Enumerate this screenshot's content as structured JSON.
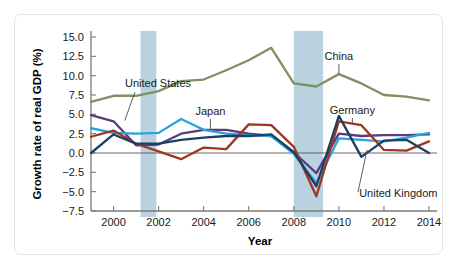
{
  "figure": {
    "y_axis_title": "Growth rate of real GDP (%)",
    "x_axis_title": "Year",
    "y_ticks": [
      "15.0",
      "12.5",
      "10.0",
      "7.5",
      "5.0",
      "2.5",
      "0.0",
      "-2.5",
      "-5.0",
      "-7.5"
    ],
    "x_ticks": [
      "2000",
      "2002",
      "2004",
      "2006",
      "2008",
      "2010",
      "2012",
      "2014"
    ],
    "annotations": {
      "united_states": "United States",
      "japan": "Japan",
      "china": "China",
      "germany": "Germany",
      "united_kingdom": "United Kingdom"
    }
  },
  "colors": {
    "united_states": "#5b3a82",
    "japan": "#29a3dd",
    "china": "#7f9163",
    "germany": "#9e3620",
    "united_kingdom": "#1d3f62",
    "recession_band": "#b9d2e0",
    "axis": "#7a7a7a",
    "card_border": "#e3e3e3"
  },
  "chart_data": {
    "type": "line",
    "title": "",
    "xlabel": "Year",
    "ylabel": "Growth rate of real GDP (%)",
    "xlim": [
      1999,
      2014
    ],
    "ylim": [
      -7.5,
      15.0
    ],
    "ytick_step": 2.5,
    "grid": false,
    "legend": "inline-annotations",
    "x": [
      1999,
      2000,
      2001,
      2002,
      2003,
      2004,
      2005,
      2006,
      2007,
      2008,
      2009,
      2010,
      2011,
      2012,
      2013,
      2014
    ],
    "series": [
      {
        "name": "China",
        "color": "#7f9163",
        "values": [
          6.6,
          7.4,
          7.4,
          8.0,
          9.3,
          9.5,
          10.7,
          12.0,
          13.6,
          9.0,
          8.6,
          10.2,
          9.0,
          7.5,
          7.3,
          6.8
        ]
      },
      {
        "name": "United States",
        "color": "#5b3a82",
        "values": [
          4.9,
          4.1,
          1.0,
          1.1,
          2.5,
          3.0,
          3.0,
          2.5,
          2.2,
          0.1,
          -2.6,
          2.5,
          2.2,
          2.3,
          2.3,
          2.4
        ]
      },
      {
        "name": "Japan",
        "color": "#29a3dd",
        "values": [
          3.2,
          2.6,
          2.5,
          2.6,
          4.4,
          3.0,
          2.5,
          2.3,
          2.2,
          -0.1,
          -3.9,
          1.9,
          1.7,
          1.5,
          2.0,
          2.6
        ]
      },
      {
        "name": "Germany",
        "color": "#9e3620",
        "values": [
          2.1,
          2.9,
          1.2,
          0.2,
          -0.8,
          0.7,
          0.5,
          3.7,
          3.6,
          0.8,
          -5.6,
          4.1,
          3.6,
          0.4,
          0.3,
          1.5
        ]
      },
      {
        "name": "United Kingdom",
        "color": "#1d3f62",
        "values": [
          0.0,
          2.4,
          1.2,
          1.2,
          1.7,
          2.0,
          2.2,
          2.2,
          2.4,
          0.1,
          -4.3,
          4.8,
          -0.5,
          1.6,
          1.7,
          0.0
        ]
      }
    ],
    "recession_bands": [
      {
        "start": 2001.2,
        "end": 2001.9
      },
      {
        "start": 2008.0,
        "end": 2009.3
      }
    ]
  }
}
